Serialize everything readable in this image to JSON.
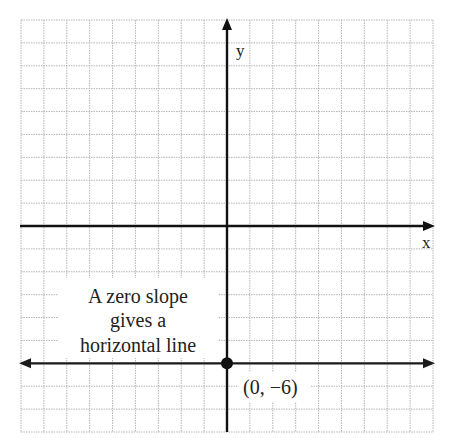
{
  "chart_data": {
    "type": "line",
    "title": "",
    "xlabel": "x",
    "ylabel": "y",
    "xlim": [
      -9,
      9
    ],
    "ylim": [
      -9,
      9
    ],
    "grid": true,
    "series": [
      {
        "name": "horizontal line y = -6",
        "slope": 0,
        "x": [
          -9,
          9
        ],
        "y": [
          -6,
          -6
        ]
      }
    ],
    "points": [
      {
        "x": 0,
        "y": -6,
        "label": "(0, −6)"
      }
    ],
    "annotation": {
      "lines": [
        "A zero slope",
        "gives a",
        "horizontal line"
      ]
    },
    "colors": {
      "axis": "#111111",
      "grid": "#b5b5b5",
      "line": "#1a1a1a"
    }
  }
}
